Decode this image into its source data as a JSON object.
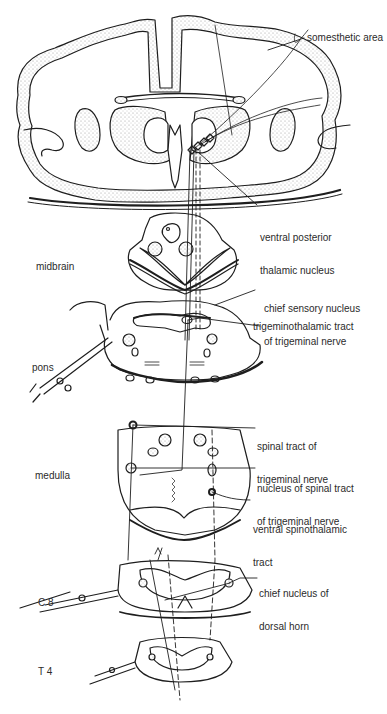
{
  "diagram": {
    "colors": {
      "ink": "#1e1e1e",
      "stipple": "#cfcfcf",
      "background": "#ffffff"
    },
    "levels": [
      {
        "id": "midbrain",
        "label": "midbrain"
      },
      {
        "id": "pons",
        "label": "pons"
      },
      {
        "id": "medulla",
        "label": "medulla"
      },
      {
        "id": "c8",
        "label": "C 8"
      },
      {
        "id": "t4",
        "label": "T 4"
      }
    ],
    "labels": [
      {
        "id": "somesthetic-area",
        "text": "somesthetic area"
      },
      {
        "id": "ventral-posterior-thalamic-nucleus",
        "line1": "ventral posterior",
        "line2": "thalamic nucleus"
      },
      {
        "id": "chief-sensory-nucleus",
        "line1": "chief sensory nucleus",
        "line2": "of trigeminal nerve"
      },
      {
        "id": "trigeminothalamic-tract",
        "text": "trigeminothalamic tract"
      },
      {
        "id": "spinal-tract-trigeminal",
        "line1": "spinal tract of",
        "line2": "trigeminal nerve"
      },
      {
        "id": "nucleus-spinal-tract",
        "line1": "nucleus of spinal tract",
        "line2": "of trigeminal nerve"
      },
      {
        "id": "ventral-spinothalamic-tract",
        "line1": "ventral spinothalamic",
        "line2": "tract"
      },
      {
        "id": "chief-nucleus-dorsal-horn",
        "line1": "chief nucleus of",
        "line2": "dorsal horn"
      }
    ]
  }
}
